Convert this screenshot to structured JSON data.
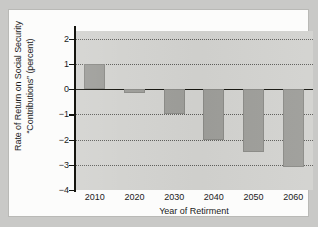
{
  "chart_data": {
    "type": "bar",
    "title": "",
    "xlabel": "Year of Retirment",
    "ylabel": "Rate of Return on Social Security\n“Contributions” (percent)",
    "categories": [
      "2010",
      "2020",
      "2030",
      "2040",
      "2050",
      "2060"
    ],
    "values": [
      1.0,
      -0.15,
      -1.0,
      -2.0,
      -2.5,
      -3.1
    ],
    "ylim": [
      -4,
      2.3
    ],
    "yticks": [
      2,
      1,
      0,
      -1,
      -2,
      -3,
      -4
    ],
    "ytick_labels": [
      "2",
      "1",
      "0",
      "−1",
      "−2",
      "−3",
      "−4"
    ],
    "grid": true,
    "grid_style": "dotted-horizontal",
    "legend": "none",
    "bar_color": "#9d9d99",
    "plot_background": "#d2d2cf",
    "axis_color": "#15150f",
    "zero_line": 0
  },
  "axes": {
    "y_title": "Rate of Return on Social Security\n“Contributions” (percent)",
    "x_title": "Year of Retirment"
  }
}
